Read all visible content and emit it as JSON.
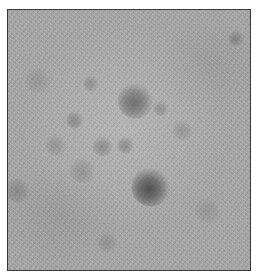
{
  "image": {
    "description": "grayscale textured micrograph with dark mottled spots inside a thin dark frame",
    "colors": {
      "frame": "#3a3a3a",
      "field": "#a3a3a3",
      "spot_dark": "#4a4a4a"
    },
    "spots": [
      {
        "x": 128,
        "y": 91,
        "r": 14,
        "darkness": 0.55
      },
      {
        "x": 143,
        "y": 177,
        "r": 15,
        "darkness": 0.8
      },
      {
        "x": 67,
        "y": 110,
        "r": 7,
        "darkness": 0.3
      },
      {
        "x": 95,
        "y": 136,
        "r": 8,
        "darkness": 0.3
      },
      {
        "x": 118,
        "y": 135,
        "r": 7,
        "darkness": 0.3
      },
      {
        "x": 83,
        "y": 73,
        "r": 6,
        "darkness": 0.25
      },
      {
        "x": 153,
        "y": 98,
        "r": 6,
        "darkness": 0.25
      },
      {
        "x": 75,
        "y": 160,
        "r": 10,
        "darkness": 0.2
      },
      {
        "x": 48,
        "y": 135,
        "r": 8,
        "darkness": 0.2
      },
      {
        "x": 175,
        "y": 120,
        "r": 8,
        "darkness": 0.18
      },
      {
        "x": 10,
        "y": 180,
        "r": 10,
        "darkness": 0.25
      },
      {
        "x": 100,
        "y": 232,
        "r": 8,
        "darkness": 0.18
      },
      {
        "x": 228,
        "y": 28,
        "r": 6,
        "darkness": 0.3
      },
      {
        "x": 200,
        "y": 200,
        "r": 10,
        "darkness": 0.15
      },
      {
        "x": 30,
        "y": 70,
        "r": 10,
        "darkness": 0.15
      }
    ]
  }
}
